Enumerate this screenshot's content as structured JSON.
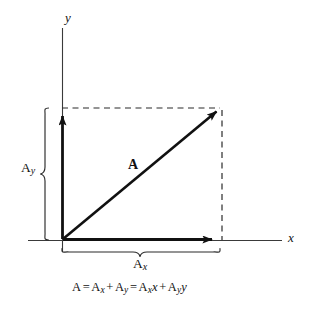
{
  "figure": {
    "background_color": "#ffffff",
    "stroke_color": "#111111"
  },
  "axes": {
    "x_label": "x",
    "y_label": "y",
    "origin": {
      "x": 62,
      "y": 240
    },
    "x_axis": {
      "x1": 28,
      "y1": 240,
      "x2": 282,
      "y2": 240
    },
    "y_axis": {
      "x1": 62,
      "y1": 28,
      "x2": 62,
      "y2": 252
    }
  },
  "vectors": {
    "resultant": {
      "label": "A",
      "from": {
        "x": 62,
        "y": 240
      },
      "to": {
        "x": 220,
        "y": 108
      },
      "label_pos": {
        "x": 128,
        "y": 158
      }
    },
    "x_component": {
      "label_main": "A",
      "label_sub": "x",
      "from": {
        "x": 62,
        "y": 240
      },
      "to": {
        "x": 218,
        "y": 240
      },
      "label_pos": {
        "x": 133,
        "y": 256
      }
    },
    "y_component": {
      "label_main": "A",
      "label_sub": "y",
      "from": {
        "x": 62,
        "y": 240
      },
      "to": {
        "x": 62,
        "y": 110
      },
      "label_pos": {
        "x": 22,
        "y": 161
      }
    }
  },
  "guides": {
    "horizontal_dashed": {
      "x1": 62,
      "y1": 108,
      "x2": 222,
      "y2": 108
    },
    "vertical_dashed": {
      "x1": 222,
      "y1": 108,
      "x2": 222,
      "y2": 240
    },
    "y_brace": {
      "x": 48,
      "y_top": 108,
      "y_bottom": 240
    },
    "x_brace": {
      "y": 248,
      "x_left": 62,
      "x_right": 220
    }
  },
  "caption": {
    "parts": {
      "a": "A",
      "eq1": "=",
      "ax_main": "A",
      "ax_sub": "x",
      "plus1": "+",
      "ay_main": "A",
      "ay_sub": "y",
      "eq2": "=",
      "bx_main": "A",
      "bx_sub": "x",
      "unit_x": "x",
      "plus2": "+",
      "by_main": "A",
      "by_sub": "y",
      "unit_y": "y"
    },
    "full_text": "A = Ax + Ay = Axx + Ayy"
  }
}
